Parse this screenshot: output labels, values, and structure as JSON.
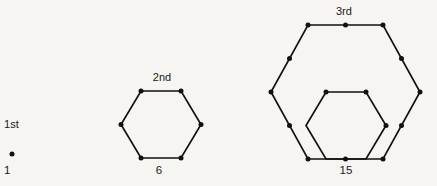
{
  "figure": {
    "background_color": "#f6f5f1",
    "ink_color": "#111111"
  },
  "chart_data": {
    "type": "scatter",
    "title": "",
    "xlabel": "",
    "ylabel": "",
    "categories": [
      "1st",
      "2nd",
      "3rd"
    ],
    "values": [
      1,
      6,
      15
    ],
    "series": [
      {
        "name": "dot count",
        "values": [
          1,
          6,
          15
        ]
      }
    ],
    "annotations": [
      "1st",
      "1",
      "2nd",
      "6",
      "3rd",
      "15"
    ],
    "grid": false,
    "legend": false,
    "stages": [
      {
        "ordinal": "1st",
        "count_label": "1",
        "dot_count": 1,
        "shapes": [],
        "dots": [
          {
            "x": 12,
            "y": 154
          }
        ]
      },
      {
        "ordinal": "2nd",
        "count_label": "6",
        "dot_count": 6,
        "shapes": [
          {
            "name": "hexagon",
            "points": "141,91 181,91 201,124.5 181,158 141,158 121,124.5"
          }
        ],
        "dots": [
          {
            "x": 141,
            "y": 91
          },
          {
            "x": 181,
            "y": 91
          },
          {
            "x": 201,
            "y": 124.5
          },
          {
            "x": 181,
            "y": 158
          },
          {
            "x": 141,
            "y": 158
          },
          {
            "x": 121,
            "y": 124.5
          }
        ]
      },
      {
        "ordinal": "3rd",
        "count_label": "15",
        "dot_count": 15,
        "shapes": [
          {
            "name": "outer-hexagon",
            "points": "308,25 383,25 420,92 383,159 308,159 271,92"
          },
          {
            "name": "inner-hexagon",
            "points": "326,92 366,92 386,125.5 366,159 326,159 306,125.5"
          }
        ],
        "dots": [
          {
            "x": 308,
            "y": 25
          },
          {
            "x": 345.5,
            "y": 25
          },
          {
            "x": 383,
            "y": 25
          },
          {
            "x": 401.5,
            "y": 58.5
          },
          {
            "x": 420,
            "y": 92
          },
          {
            "x": 401.5,
            "y": 125.5
          },
          {
            "x": 383,
            "y": 159
          },
          {
            "x": 345.5,
            "y": 159
          },
          {
            "x": 308,
            "y": 159
          },
          {
            "x": 289.5,
            "y": 125.5
          },
          {
            "x": 271,
            "y": 92
          },
          {
            "x": 289.5,
            "y": 58.5
          },
          {
            "x": 326,
            "y": 92
          },
          {
            "x": 366,
            "y": 92
          },
          {
            "x": 386,
            "y": 125.5
          }
        ]
      }
    ]
  }
}
